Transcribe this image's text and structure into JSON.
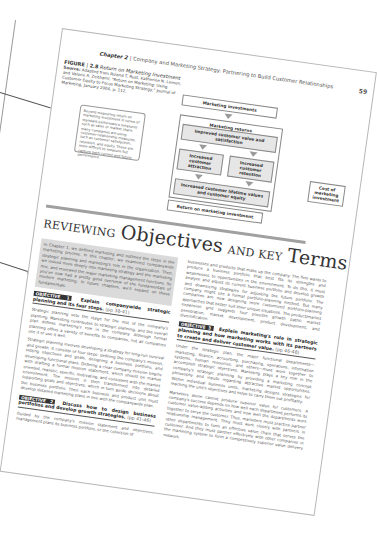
{
  "header": {
    "chapter_label": "Chapter 2",
    "chapter_title": "Company and Marketing Strategy: Partnering to Build Customer Relationships",
    "page_number": "59"
  },
  "figure": {
    "label": "FIGURE",
    "number": "2.8",
    "title": "Return on Marketing Investment",
    "source_label": "Source:",
    "source_text": "Adapted from Roland T. Rust, Katherine N. Lemon, and Valarie A. Zeithaml, \"Return on Marketing: Using Customer Equity to Focus Marketing Strategy,\" Journal of Marketing, January 2004, p. 112.",
    "callout": "Beyond measuring return on marketing investment in terms of standard performance measures such as sales or market share, many companies are using customer relationship measures, such as customer satisfaction, retention, and equity. These are more difficult to measure but capture both current and future performance."
  },
  "diagram": {
    "top": "Marketing investments",
    "returns_title": "Marketing returns",
    "improved": "Improved customer value and satisfaction",
    "attraction": "Increased customer attraction",
    "retention": "Increased customer retention",
    "lifetime": "Increased customer lifetime values and customer equity",
    "cost": "Cost of marketing investment",
    "bottom": "Return on marketing investment"
  },
  "section_title": {
    "prefix": "REVIEWING",
    "word1": "Objectives",
    "mid": "AND KEY",
    "word2": "Terms"
  },
  "intro_text": "In Chapter 1, we defined marketing and outlined the steps in the marketing process. In this chapter, we examined companywide strategic planning and marketing's role in the organization. Then, we looked more deeply into marketing strategy and the marketing mix, and reviewed the major marketing management functions. So you've now had a pretty good overview of the fundamentals of modern marketing. In future chapters, we'll expand on these fundamentals.",
  "objectives": [
    {
      "tag": "OBJECTIVE 1",
      "heading": "Explain companywide strategic planning and its four steps.",
      "pages": "(pp 38-41)",
      "body": [
        "Strategic planning sets the stage for the rest of the company's planning. Marketing contributes to strategic planning, and the overall plan defines marketing's role in the company. Although formal planning offers a variety of benefits to companies, not all companies use it or use it well.",
        "Strategic planning involves developing a strategy for long-run survival and growth. It consists of four steps: defining the company's mission, setting objectives and goals, designing a business portfolio, and developing functional plans. Defining a clear company mission begins with drafting a formal mission statement, which should be market oriented, realistic, specific, motivating, and consistent with the market environment. The mission is then transformed into detailed supporting goals and objectives, which in turn guide decisions about the business portfolio. Then each business and product unit must develop detailed marketing plans in line with the companywide plan."
      ]
    },
    {
      "tag": "OBJECTIVE 2",
      "heading": "Discuss how to design business portfolios and develop growth strategies.",
      "pages": "(pp 41-46)",
      "body": [
        "Guided by the company's mission statement and objectives, management plans its business portfolio, or the collection of"
      ]
    },
    {
      "tag": "OBJECTIVE 3",
      "heading": "Explain marketing's role in strategic planning and how marketing works with its partners to create and deliver customer value.",
      "pages": "(pp 46-48)",
      "body": [
        "Under the strategic plan, the major functional departments—marketing, finance, accounting, purchasing, operations, information systems, human resources, and others—must work together to accomplish strategic objectives. Marketing plays a key role in the company's strategic planning by providing a marketing concept philosophy and inputs regarding attractive market opportunities. Within individual business units, marketing designs strategies for reaching the unit's objectives and helps to carry them out profitably.",
        "Marketers alone cannot produce superior value for customers. A company's success depends on how well each department performs its customer value-adding activities and how well the departments work together to serve the customer. Thus, marketers must practice partner relationship management. They must work closely with partners in other departments to form an effective value chain that serves the customer. And they must partner effectively with other companies in the marketing system to form a competitively superior value delivery network."
      ]
    }
  ],
  "col2_lead": "businesses and products that make up the company. The firm wants to produce a business portfolio that best fits its strengths and weaknesses to opportunities in the environment. To do this, it must analyze and adjust its current business portfolio and develop growth and downsizing strategies for adjusting the future portfolio. The company might use a formal portfolio-planning method. But many companies are now designing more customized portfolio-planning approaches that better suit their unique situations. The product/market expansion grid suggests four possible growth paths: market penetration, market development, product development, and diversification."
}
